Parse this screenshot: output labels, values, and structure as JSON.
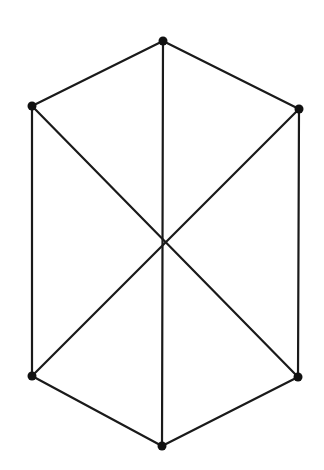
{
  "diagram": {
    "type": "graph",
    "background": "#ffffff",
    "edge_color": "#1a1a1a",
    "node_color": "#111111",
    "node_radius": 4.5,
    "nodes": [
      {
        "id": "top",
        "x": 163,
        "y": 41
      },
      {
        "id": "upper-left",
        "x": 32,
        "y": 106
      },
      {
        "id": "upper-right",
        "x": 299,
        "y": 109
      },
      {
        "id": "lower-left",
        "x": 32,
        "y": 376
      },
      {
        "id": "lower-right",
        "x": 298,
        "y": 377
      },
      {
        "id": "bottom",
        "x": 162,
        "y": 446
      }
    ],
    "edges": [
      {
        "from": "top",
        "to": "upper-left"
      },
      {
        "from": "top",
        "to": "upper-right"
      },
      {
        "from": "top",
        "to": "bottom"
      },
      {
        "from": "upper-left",
        "to": "lower-left"
      },
      {
        "from": "upper-right",
        "to": "lower-right"
      },
      {
        "from": "upper-left",
        "to": "lower-right"
      },
      {
        "from": "upper-right",
        "to": "lower-left"
      },
      {
        "from": "lower-left",
        "to": "bottom"
      },
      {
        "from": "lower-right",
        "to": "bottom"
      }
    ]
  }
}
